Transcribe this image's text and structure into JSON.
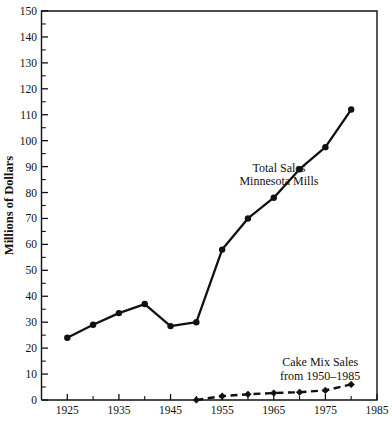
{
  "chart_data": {
    "type": "line",
    "title": "",
    "xlabel": "",
    "ylabel": "Millions of Dollars",
    "xlim": [
      1920,
      1985
    ],
    "ylim": [
      0,
      150
    ],
    "grid": false,
    "legend_position": "inline-annotation",
    "x_ticks_major": [
      1925,
      1935,
      1945,
      1955,
      1965,
      1975,
      1985
    ],
    "x_ticks_minor": [
      1930,
      1940,
      1950,
      1960,
      1970,
      1980
    ],
    "x_tick_labels": [
      "1925",
      "1935",
      "1945",
      "1955",
      "1965",
      "1975",
      "1985"
    ],
    "y_ticks_major": [
      0,
      10,
      20,
      30,
      40,
      50,
      60,
      70,
      80,
      90,
      100,
      110,
      120,
      130,
      140,
      150
    ],
    "y_ticks_minor": [
      5,
      15,
      25,
      35,
      45,
      55,
      65,
      75,
      85,
      95,
      105,
      115,
      125,
      135,
      145
    ],
    "y_tick_labels": [
      "0",
      "10",
      "20",
      "30",
      "40",
      "50",
      "60",
      "70",
      "80",
      "90",
      "100",
      "110",
      "120",
      "130",
      "140",
      "150"
    ],
    "series": [
      {
        "name": "Total Sales Minnesota Mills",
        "style": "solid",
        "marker": "circle",
        "color": "#111111",
        "x": [
          1925,
          1930,
          1935,
          1940,
          1945,
          1950,
          1955,
          1960,
          1965,
          1970,
          1975,
          1980
        ],
        "values": [
          24,
          29,
          33.5,
          37,
          28.5,
          30,
          58,
          70,
          78,
          89,
          97.5,
          112
        ]
      },
      {
        "name": "Cake Mix Sales from 1950-1985",
        "style": "dashed",
        "marker": "diamond",
        "color": "#111111",
        "x": [
          1950,
          1955,
          1960,
          1965,
          1970,
          1975,
          1980
        ],
        "values": [
          0,
          1.5,
          2.2,
          2.7,
          3.0,
          3.7,
          6.0
        ]
      }
    ],
    "annotations": [
      {
        "id": "total-sales",
        "line1": "Total Sales",
        "line2": "Minnesota Mills",
        "x": 1966,
        "y": 88
      },
      {
        "id": "cake-mix-sales",
        "line1": "Cake Mix Sales",
        "line2": "from 1950–1985",
        "x": 1974,
        "y": 13
      }
    ]
  }
}
